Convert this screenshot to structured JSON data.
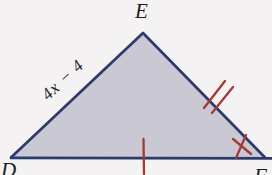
{
  "figure": {
    "type": "triangle",
    "vertices": {
      "top": {
        "label": "E"
      },
      "bottom_left": {
        "label": "D"
      },
      "bottom_right": {
        "label": "F"
      }
    },
    "side_label_DE": "4x − 4",
    "marks": {
      "side_EF": "double-tick",
      "side_DF": "single-tick",
      "near_F": "cross-tick"
    },
    "colors": {
      "background": "#f4f2f2",
      "triangle_fill": "#cac8d2",
      "triangle_stroke": "#2d3a6d",
      "tick": "#a23a37",
      "label": "#1c1c1c"
    }
  }
}
